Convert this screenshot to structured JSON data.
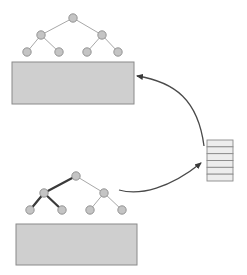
{
  "diagram": {
    "title": "",
    "colors": {
      "background": "#ffffff",
      "block_fill": "#cfcfcf",
      "block_stroke": "#8a8a8a",
      "node_fill": "#c4c4c4",
      "node_stroke": "#8c8c8c",
      "edge_light": "#a8a8a8",
      "edge_highlight": "#3a3a3a",
      "arrow": "#4a4a4a",
      "stack_fill": "#ededed",
      "stack_stroke": "#8a8a8a"
    },
    "top_tree": {
      "nodes": [
        {
          "id": "root",
          "x": 73,
          "y": 18
        },
        {
          "id": "l",
          "x": 41,
          "y": 35
        },
        {
          "id": "r",
          "x": 102,
          "y": 35
        },
        {
          "id": "ll",
          "x": 27,
          "y": 52
        },
        {
          "id": "lr",
          "x": 59,
          "y": 52
        },
        {
          "id": "rl",
          "x": 87,
          "y": 52
        },
        {
          "id": "rr",
          "x": 118,
          "y": 52
        }
      ],
      "edges": [
        {
          "from": "root",
          "to": "l",
          "highlight": false
        },
        {
          "from": "root",
          "to": "r",
          "highlight": false
        },
        {
          "from": "l",
          "to": "ll",
          "highlight": false
        },
        {
          "from": "l",
          "to": "lr",
          "highlight": false
        },
        {
          "from": "r",
          "to": "rl",
          "highlight": false
        },
        {
          "from": "r",
          "to": "rr",
          "highlight": false
        }
      ],
      "block": {
        "x": 12,
        "y": 62,
        "width": 122,
        "height": 42
      }
    },
    "bottom_tree": {
      "nodes": [
        {
          "id": "root",
          "x": 76,
          "y": 176
        },
        {
          "id": "l",
          "x": 44,
          "y": 193
        },
        {
          "id": "r",
          "x": 104,
          "y": 193
        },
        {
          "id": "ll",
          "x": 30,
          "y": 210
        },
        {
          "id": "lr",
          "x": 62,
          "y": 210
        },
        {
          "id": "rl",
          "x": 90,
          "y": 210
        },
        {
          "id": "rr",
          "x": 122,
          "y": 210
        }
      ],
      "edges": [
        {
          "from": "root",
          "to": "l",
          "highlight": true
        },
        {
          "from": "root",
          "to": "r",
          "highlight": false
        },
        {
          "from": "l",
          "to": "ll",
          "highlight": true
        },
        {
          "from": "l",
          "to": "lr",
          "highlight": true
        },
        {
          "from": "r",
          "to": "rl",
          "highlight": false
        },
        {
          "from": "r",
          "to": "rr",
          "highlight": false
        }
      ],
      "block": {
        "x": 16,
        "y": 224,
        "width": 121,
        "height": 41
      }
    },
    "stack": {
      "x": 207,
      "y": 140,
      "width": 26,
      "height": 41,
      "rows": 6
    },
    "arrows": [
      {
        "id": "bottom-tree-to-stack",
        "path": "M119,190 C140,196 170,188 201,163",
        "head": {
          "x": 201,
          "y": 163,
          "angle": -40
        }
      },
      {
        "id": "stack-to-top-block",
        "path": "M204,146 C198,100 175,82 137,76",
        "head": {
          "x": 137,
          "y": 76,
          "angle": 190
        }
      }
    ],
    "node_radius": 4.2
  }
}
